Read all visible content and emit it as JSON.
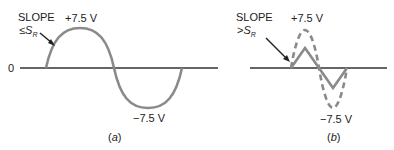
{
  "panel_a": {
    "slope_label": "SLOPE",
    "slope_cond_prefix": "≤",
    "slope_cond_var": "S",
    "slope_cond_sub": "R",
    "peak_pos": "+7.5 V",
    "peak_neg": "−7.5 V",
    "zero_label": "0",
    "caption_open": "(",
    "caption_letter": "a",
    "caption_close": ")"
  },
  "panel_b": {
    "slope_label": "SLOPE",
    "slope_cond_prefix": ">",
    "slope_cond_var": "S",
    "slope_cond_sub": "R",
    "peak_pos": "+7.5 V",
    "peak_neg": "−7.5 V",
    "caption_open": "(",
    "caption_letter": "b",
    "caption_close": ")"
  },
  "colors": {
    "wave": "#8a8a8a",
    "axis": "#333333",
    "text": "#222222"
  }
}
